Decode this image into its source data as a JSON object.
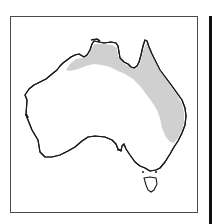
{
  "map": {
    "subject": "Australia distribution map",
    "region": "Australia",
    "shaded_area": "Northern and eastern Australia (Top End, Cape York, Queensland coast)",
    "colors": {
      "land": "#ffffff",
      "range_fill": "#d0d0d0",
      "coastline": "#1a1a1a",
      "frame": "#4a4a4a"
    }
  }
}
